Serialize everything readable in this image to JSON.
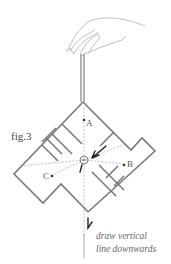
{
  "figure": {
    "label": "fig.3",
    "points": [
      {
        "name": "A",
        "x": 88,
        "y": 125
      },
      {
        "name": "B",
        "x": 130,
        "y": 166
      },
      {
        "name": "C",
        "x": 48,
        "y": 175
      }
    ],
    "center": {
      "x": 84,
      "y": 160
    },
    "caption_line1": "draw vertical",
    "caption_line2": "line downwards",
    "colors": {
      "walls": "#7a7a7a",
      "string": "#555555",
      "dashed": "#999999",
      "arrows": "#333333",
      "hand": "#aaaaaa"
    }
  }
}
